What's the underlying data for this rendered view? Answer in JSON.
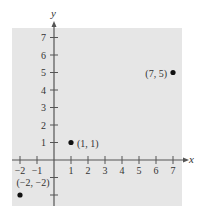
{
  "chart_data": {
    "type": "scatter",
    "title": "",
    "xlabel": "x",
    "ylabel": "y",
    "xlim": [
      -2,
      7
    ],
    "ylim": [
      -2,
      7
    ],
    "x_ticks": [
      -2,
      -1,
      1,
      2,
      3,
      4,
      5,
      6,
      7
    ],
    "y_ticks": [
      1,
      2,
      3,
      4,
      5,
      6,
      7
    ],
    "y_ticks_unlabeled": [
      -1,
      -2
    ],
    "grid": false,
    "background": "#e6e6e6",
    "points": [
      {
        "x": 1,
        "y": 1,
        "label": "(1, 1)"
      },
      {
        "x": 7,
        "y": 5,
        "label": "(7, 5)"
      },
      {
        "x": -2,
        "y": -2,
        "label": "(−2, −2)"
      }
    ]
  },
  "colors": {
    "panel": "#e6e6e6",
    "axis": "#555555",
    "text": "#333333",
    "point": "#111111"
  }
}
